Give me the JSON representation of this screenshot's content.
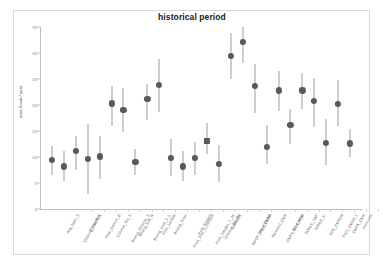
{
  "chart": {
    "title": "historical period",
    "ylabel": "area flown / year"
  },
  "chart_data": {
    "type": "scatter",
    "title": "historical period",
    "xlabel": "",
    "ylabel": "area flown / year",
    "ylim": [
      0,
      35
    ],
    "yticks": [
      0,
      5,
      10,
      15,
      20,
      25,
      30,
      35
    ],
    "ytick_labels": [
      "0",
      "5",
      "10",
      "15",
      "20",
      "25",
      "30",
      "35"
    ],
    "grid": false,
    "legend": false,
    "error_bars": "vertical",
    "marker_color": "#595959",
    "errorbar_color": "#9b9b9b",
    "categories": [
      "Ang_Nam_S",
      "Chhlong_CMPA_1",
      "Chrey_Bak",
      "Kbal_Damrei_B",
      "Chhnok_Tru_S",
      "Boeng_Chhmar_S",
      "Boeng_Kak_N",
      "Boeng_Veal_S_L",
      "Phat_Sanday",
      "Boeng_Tonle",
      "Prek_Toal_1_medium",
      "Prek_Khsach",
      "Prek_Sangke_1_2a",
      "Chhnok_Tru_Bk",
      "CARDDI1",
      "MPDP_CMA_CMPA",
      "Dey_CDCAD",
      "Rumduol_CMA",
      "CMPA_MPA_N_M",
      "TC_CARDI",
      "TONLE_SAP",
      "TONLE_LI",
      "KPK_CMPDA",
      "PrCh_CMPA_1",
      "CMPA_CMA",
      "reservoirs"
    ],
    "values": [
      9.4,
      8.2,
      11.1,
      9.6,
      10.1,
      20.3,
      19.0,
      9.0,
      21.1,
      23.9,
      9.9,
      8.2,
      9.8,
      13.1,
      8.7,
      29.4,
      32.2,
      23.7,
      12.0,
      22.8,
      16.1,
      22.8,
      20.8,
      12.7,
      20.2,
      12.6
    ],
    "error_low": [
      6.6,
      5.4,
      7.5,
      2.9,
      5.7,
      16.0,
      14.8,
      6.6,
      17.2,
      18.7,
      6.4,
      5.3,
      6.6,
      10.6,
      5.1,
      25.0,
      28.0,
      18.4,
      8.6,
      18.8,
      12.5,
      19.2,
      15.8,
      8.4,
      16.0,
      10.0
    ],
    "error_high": [
      12.2,
      11.2,
      14.1,
      16.4,
      14.0,
      23.6,
      23.3,
      11.6,
      24.0,
      28.8,
      13.5,
      11.1,
      12.8,
      16.5,
      12.4,
      33.8,
      35.0,
      27.9,
      16.2,
      26.5,
      19.3,
      26.1,
      25.2,
      17.3,
      24.8,
      15.3
    ],
    "marker_shapes": [
      "circle",
      "circle",
      "circle",
      "circle",
      "circle",
      "circle",
      "circle",
      "circle",
      "circle",
      "circle",
      "circle",
      "circle",
      "circle",
      "square",
      "circle",
      "circle",
      "circle",
      "circle",
      "circle",
      "circle",
      "circle",
      "circle",
      "circle",
      "circle",
      "circle",
      "circle"
    ]
  }
}
